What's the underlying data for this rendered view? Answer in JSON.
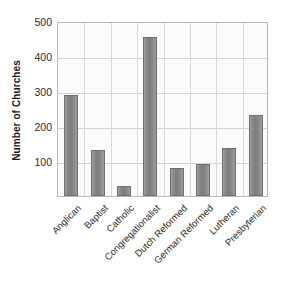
{
  "chart_data": {
    "type": "bar",
    "title": "",
    "subtitle": "",
    "xlabel": "",
    "ylabel": "Number of Churches",
    "categories": [
      "Anglican",
      "Baptist",
      "Catholic",
      "Congregationalist",
      "Dutch Reformed",
      "German Reformed",
      "Lutheran",
      "Presbyterian"
    ],
    "values": [
      288,
      132,
      28,
      455,
      80,
      92,
      137,
      232
    ],
    "series": [
      {
        "name": "Number of Churches",
        "values": [
          288,
          132,
          28,
          455,
          80,
          92,
          137,
          232
        ]
      }
    ],
    "ylim": [
      0,
      500
    ],
    "yticks": [
      100,
      200,
      300,
      400,
      500
    ],
    "ytick_labels": [
      "100",
      "200",
      "300",
      "400",
      "500"
    ],
    "grid": true,
    "grid_axis": "both",
    "legend": false,
    "legend_position": "none",
    "bar_color": "#808080",
    "bar_edge_color": "#6f6f6f",
    "plot_background": "#fbfbfb",
    "grid_color": "#d2d2d2",
    "axis_color": "#b9b9b9",
    "text_color": "#2b2b2b",
    "xtick_rotation": -45
  }
}
